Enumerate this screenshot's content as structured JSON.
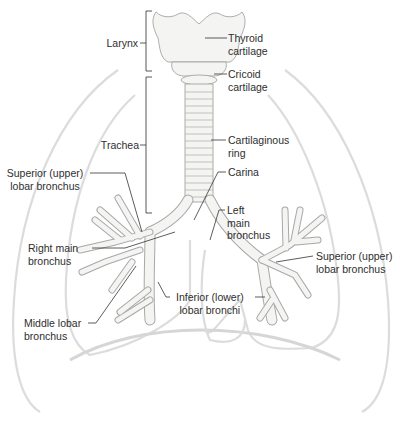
{
  "figure": {
    "colors": {
      "background": "#ffffff",
      "lung_outline": "#dcdcdc",
      "airway_fill": "#f4f4f2",
      "airway_stroke": "#9a9a9a",
      "leader_line": "#333333",
      "text": "#2e2e2e"
    },
    "labels": {
      "larynx": "Larynx",
      "thyroid_cartilage": "Thyroid\ncartilage",
      "cricoid_cartilage": "Cricoid\ncartilage",
      "trachea": "Trachea",
      "cartilaginous_ring": "Cartilaginous\nring",
      "carina": "Carina",
      "superior_lobar_right": "Superior (upper)\nlobar bronchus",
      "left_main_bronchus": "Left\nmain\nbronchus",
      "right_main_bronchus": "Right main\nbronchus",
      "superior_lobar_left": "Superior (upper)\nlobar bronchus",
      "middle_lobar": "Middle lobar\nbronchus",
      "inferior_lobar": "Inferior (lower)\nlobar bronchi"
    }
  }
}
